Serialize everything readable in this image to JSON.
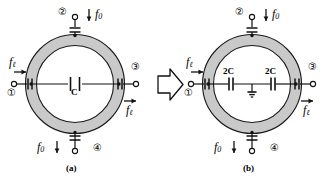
{
  "figure": {
    "title": "",
    "panels": [
      {
        "id": "a",
        "caption": "(a)",
        "ring": {
          "shape": "annulus",
          "fill": "#c9c9c9",
          "stroke": "#1a1a1a"
        },
        "center_element": {
          "type": "capacitor",
          "label": "C"
        },
        "ports": [
          {
            "number": "①",
            "position": "left",
            "signal": "f",
            "signal_sub": "ℓ",
            "arrow": "right",
            "coupling": "series-capacitor"
          },
          {
            "number": "②",
            "position": "top",
            "signal": "f",
            "signal_sub": "0",
            "arrow": "down",
            "coupling": "series-capacitor"
          },
          {
            "number": "③",
            "position": "right",
            "signal": "f",
            "signal_sub": "ℓ",
            "arrow": "right",
            "coupling": "series-capacitor"
          },
          {
            "number": "④",
            "position": "bottom",
            "signal": "f",
            "signal_sub": "0",
            "arrow": "down",
            "coupling": "series-capacitor"
          }
        ]
      },
      {
        "id": "b",
        "caption": "(b)",
        "ring": {
          "shape": "annulus",
          "fill": "#c9c9c9",
          "stroke": "#1a1a1a"
        },
        "center_element": {
          "type": "split-capacitor-pair",
          "label_left": "2C",
          "label_right": "2C",
          "ground": "ground-symbol"
        },
        "ports": [
          {
            "number": "①",
            "position": "left",
            "signal": "f",
            "signal_sub": "ℓ",
            "arrow": "right",
            "coupling": "series-capacitor"
          },
          {
            "number": "②",
            "position": "top",
            "signal": "f",
            "signal_sub": "0",
            "arrow": "down",
            "coupling": "series-capacitor"
          },
          {
            "number": "③",
            "position": "right",
            "signal": "f",
            "signal_sub": "ℓ",
            "arrow": "right",
            "coupling": "series-capacitor"
          },
          {
            "number": "④",
            "position": "bottom",
            "signal": "f",
            "signal_sub": "0",
            "arrow": "down",
            "coupling": "series-capacitor"
          }
        ]
      }
    ],
    "transform_arrow": {
      "glyph": "block-arrow-right",
      "direction": "right"
    }
  },
  "labels": {
    "f_letter": "f",
    "sub_l": "ℓ",
    "sub_0": "0",
    "C": "C",
    "twoC": "2C",
    "port1": "①",
    "port2": "②",
    "port3": "③",
    "port4": "④",
    "caption_a": "(a)",
    "caption_b": "(b)"
  },
  "colors": {
    "ring_fill": "#c9c9c9",
    "ink": "#111111",
    "background": "#ffffff"
  }
}
